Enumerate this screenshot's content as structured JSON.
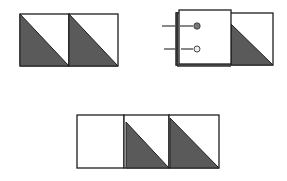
{
  "diagram": {
    "colors": {
      "line": "#1e1e1e",
      "fill_dark": "#5a5a5a",
      "fill_light": "#ffffff",
      "pin_head_dark": "#777777",
      "pin_head_light": "#eeeeee"
    },
    "panels": [
      {
        "id": "two-hst-units",
        "units": [
          "hst",
          "hst"
        ]
      },
      {
        "id": "square-pinned-on-hst",
        "units": [
          "plain-square-pinned",
          "hst"
        ],
        "pins": 2
      },
      {
        "id": "row-assembled",
        "units": [
          "plain",
          "hst",
          "hst"
        ]
      }
    ]
  }
}
